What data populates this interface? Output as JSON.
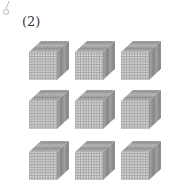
{
  "problem": {
    "label": "(2)",
    "description": "3 by 3 arrangement of thousand-cubes (10x10x10 base-ten blocks)",
    "rows": 3,
    "columns": 3,
    "cube_count": 9
  },
  "colors": {
    "face_fill": "#c8c8c8",
    "grid_line": "#7a7a7a",
    "top_fill": "#b4b4b4",
    "side_fill": "#a0a0a0"
  }
}
